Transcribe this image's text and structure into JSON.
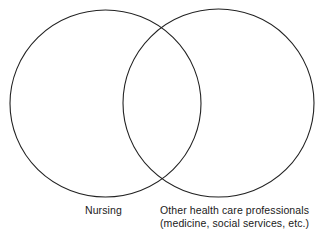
{
  "diagram": {
    "type": "venn",
    "stroke_color": "#222222",
    "sets": [
      {
        "id": "nursing",
        "label_lines": [
          "Nursing"
        ],
        "circle": {
          "cx": 105.5,
          "cy": 103.5,
          "rx": 95.5,
          "ry": 93.5
        }
      },
      {
        "id": "other-health-care-professionals",
        "label_lines": [
          "Other health care professionals",
          "(medicine, social services, etc.)"
        ],
        "circle": {
          "cx": 218.5,
          "cy": 103,
          "rx": 95.5,
          "ry": 94
        }
      }
    ]
  }
}
